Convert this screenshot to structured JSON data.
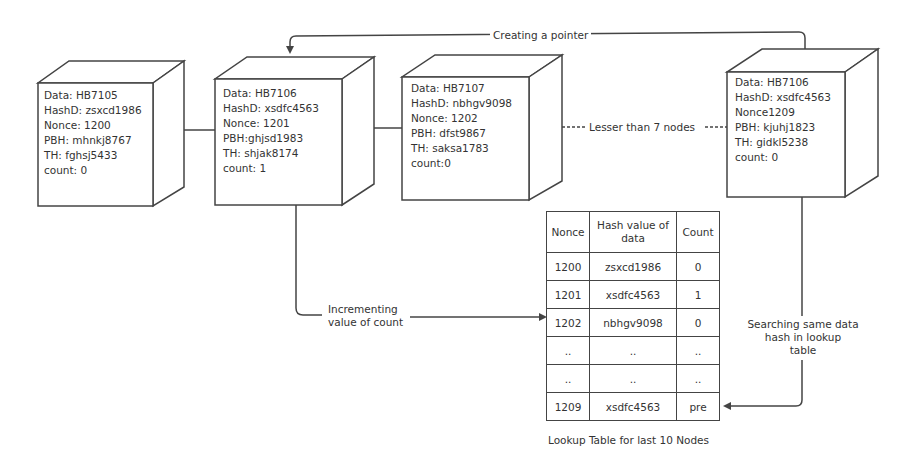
{
  "diagram": {
    "pointer_label": "Creating a pointer",
    "gap_label": "Lesser than 7 nodes",
    "increment_label": [
      "Incrementing",
      "value of count"
    ],
    "search_label": [
      "Searching same data",
      "hash in lookup",
      "table"
    ]
  },
  "blocks": [
    {
      "lines": [
        "Data: HB7105",
        "HashD: zsxcd1986",
        "Nonce: 1200",
        "PBH: mhnkj8767",
        "TH: fghsj5433",
        "count: 0"
      ]
    },
    {
      "lines": [
        "Data: HB7106",
        "HashD: xsdfc4563",
        "Nonce: 1201",
        "PBH:ghjsd1983",
        "TH: shjak8174",
        "count: 1"
      ]
    },
    {
      "lines": [
        "Data: HB7107",
        "HashD: nbhgv9098",
        "Nonce: 1202",
        "PBH: dfst9867",
        "TH: saksa1783",
        "count:0"
      ]
    },
    {
      "lines": [
        "Data: HB7106",
        "HashD: xsdfc4563",
        "Nonce1209",
        "PBH: kjuhj1823",
        "TH: gidkl5238",
        "count: 0"
      ]
    }
  ],
  "lookup_table": {
    "headers": [
      "Nonce",
      "Hash value of data",
      "Count"
    ],
    "rows": [
      [
        "1200",
        "zsxcd1986",
        "0"
      ],
      [
        "1201",
        "xsdfc4563",
        "1"
      ],
      [
        "1202",
        "nbhgv9098",
        "0"
      ],
      [
        "..",
        "..",
        ".."
      ],
      [
        "..",
        "..",
        ".."
      ],
      [
        "1209",
        "xsdfc4563",
        "pre"
      ]
    ],
    "caption": "Lookup Table for last 10 Nodes"
  }
}
